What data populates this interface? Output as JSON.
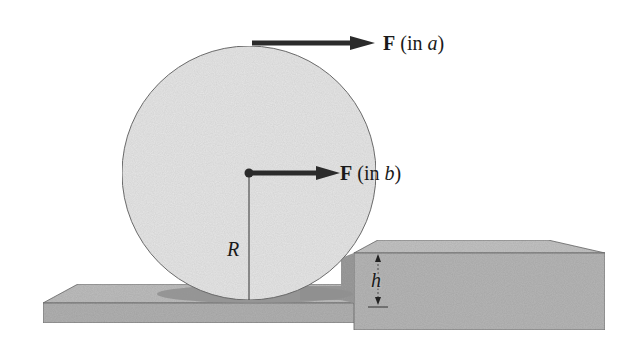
{
  "figure": {
    "labels": {
      "force_a": {
        "symbol": "F",
        "paren_open": " (in ",
        "case": "a",
        "paren_close": ")"
      },
      "force_b": {
        "symbol": "F",
        "paren_open": " (in ",
        "case": "b",
        "paren_close": ")"
      },
      "radius": "R",
      "step_height": "h"
    },
    "colors": {
      "wheel_fill": "#e6e6e6",
      "surface_fill": "#b4b4b4",
      "surface_top": "#bdbdbd",
      "shadow": "#8f8f8f",
      "arrow": "#2b2b2b",
      "outline": "#6a6a6a"
    }
  }
}
